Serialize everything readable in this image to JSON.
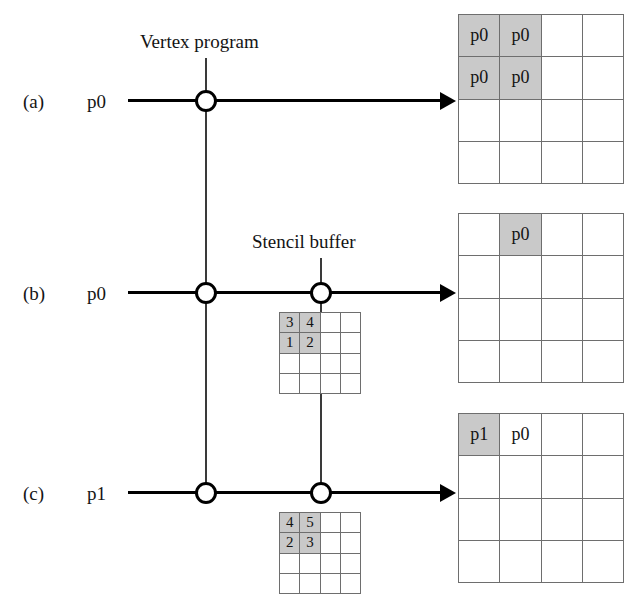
{
  "figure": {
    "type": "diagram"
  },
  "captions": {
    "vertex_program": "Vertex program",
    "stencil_buffer": "Stencil buffer"
  },
  "rows": [
    {
      "tag": "(a)",
      "input_label": "p0",
      "nodes": [
        "vertex-program-node"
      ],
      "stencil": null,
      "framebuffer": {
        "cols": 4,
        "rows": 4,
        "cells": [
          {
            "text": "p0",
            "shaded": true
          },
          {
            "text": "p0",
            "shaded": true
          },
          {
            "text": "",
            "shaded": false
          },
          {
            "text": "",
            "shaded": false
          },
          {
            "text": "p0",
            "shaded": true
          },
          {
            "text": "p0",
            "shaded": true
          },
          {
            "text": "",
            "shaded": false
          },
          {
            "text": "",
            "shaded": false
          },
          {
            "text": "",
            "shaded": false
          },
          {
            "text": "",
            "shaded": false
          },
          {
            "text": "",
            "shaded": false
          },
          {
            "text": "",
            "shaded": false
          },
          {
            "text": "",
            "shaded": false
          },
          {
            "text": "",
            "shaded": false
          },
          {
            "text": "",
            "shaded": false
          },
          {
            "text": "",
            "shaded": false
          }
        ]
      }
    },
    {
      "tag": "(b)",
      "input_label": "p0",
      "nodes": [
        "vertex-program-node",
        "stencil-buffer-node"
      ],
      "stencil": {
        "cols": 4,
        "rows": 4,
        "cells": [
          {
            "text": "3",
            "shaded": true
          },
          {
            "text": "4",
            "shaded": true
          },
          {
            "text": "",
            "shaded": false
          },
          {
            "text": "",
            "shaded": false
          },
          {
            "text": "1",
            "shaded": true
          },
          {
            "text": "2",
            "shaded": true
          },
          {
            "text": "",
            "shaded": false
          },
          {
            "text": "",
            "shaded": false
          },
          {
            "text": "",
            "shaded": false
          },
          {
            "text": "",
            "shaded": false
          },
          {
            "text": "",
            "shaded": false
          },
          {
            "text": "",
            "shaded": false
          },
          {
            "text": "",
            "shaded": false
          },
          {
            "text": "",
            "shaded": false
          },
          {
            "text": "",
            "shaded": false
          },
          {
            "text": "",
            "shaded": false
          }
        ]
      },
      "framebuffer": {
        "cols": 4,
        "rows": 4,
        "cells": [
          {
            "text": "",
            "shaded": false
          },
          {
            "text": "p0",
            "shaded": true
          },
          {
            "text": "",
            "shaded": false
          },
          {
            "text": "",
            "shaded": false
          },
          {
            "text": "",
            "shaded": false
          },
          {
            "text": "",
            "shaded": false
          },
          {
            "text": "",
            "shaded": false
          },
          {
            "text": "",
            "shaded": false
          },
          {
            "text": "",
            "shaded": false
          },
          {
            "text": "",
            "shaded": false
          },
          {
            "text": "",
            "shaded": false
          },
          {
            "text": "",
            "shaded": false
          },
          {
            "text": "",
            "shaded": false
          },
          {
            "text": "",
            "shaded": false
          },
          {
            "text": "",
            "shaded": false
          },
          {
            "text": "",
            "shaded": false
          }
        ]
      }
    },
    {
      "tag": "(c)",
      "input_label": "p1",
      "nodes": [
        "vertex-program-node",
        "stencil-buffer-node"
      ],
      "stencil": {
        "cols": 4,
        "rows": 4,
        "cells": [
          {
            "text": "4",
            "shaded": true
          },
          {
            "text": "5",
            "shaded": true
          },
          {
            "text": "",
            "shaded": false
          },
          {
            "text": "",
            "shaded": false
          },
          {
            "text": "2",
            "shaded": true
          },
          {
            "text": "3",
            "shaded": true
          },
          {
            "text": "",
            "shaded": false
          },
          {
            "text": "",
            "shaded": false
          },
          {
            "text": "",
            "shaded": false
          },
          {
            "text": "",
            "shaded": false
          },
          {
            "text": "",
            "shaded": false
          },
          {
            "text": "",
            "shaded": false
          },
          {
            "text": "",
            "shaded": false
          },
          {
            "text": "",
            "shaded": false
          },
          {
            "text": "",
            "shaded": false
          },
          {
            "text": "",
            "shaded": false
          }
        ]
      },
      "framebuffer": {
        "cols": 4,
        "rows": 4,
        "cells": [
          {
            "text": "p1",
            "shaded": true
          },
          {
            "text": "p0",
            "shaded": false
          },
          {
            "text": "",
            "shaded": false
          },
          {
            "text": "",
            "shaded": false
          },
          {
            "text": "",
            "shaded": false
          },
          {
            "text": "",
            "shaded": false
          },
          {
            "text": "",
            "shaded": false
          },
          {
            "text": "",
            "shaded": false
          },
          {
            "text": "",
            "shaded": false
          },
          {
            "text": "",
            "shaded": false
          },
          {
            "text": "",
            "shaded": false
          },
          {
            "text": "",
            "shaded": false
          },
          {
            "text": "",
            "shaded": false
          },
          {
            "text": "",
            "shaded": false
          },
          {
            "text": "",
            "shaded": false
          },
          {
            "text": "",
            "shaded": false
          }
        ]
      }
    }
  ],
  "colors": {
    "shaded_cell": "#c9c9c9",
    "grid_line": "#6e6e6e",
    "wire": "#000000",
    "text": "#141414"
  }
}
